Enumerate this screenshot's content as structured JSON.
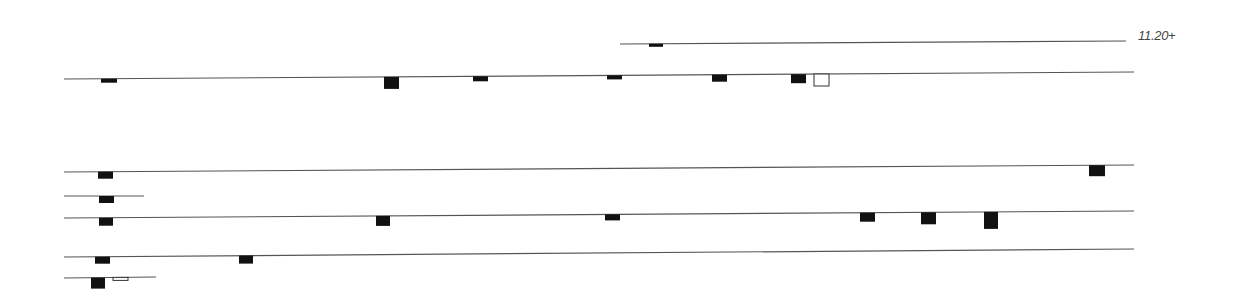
{
  "diagram": {
    "width": 1241,
    "height": 302,
    "line_color": "#555555",
    "fill_color": "#111111",
    "open_stroke": "#333333",
    "label": {
      "text": "11.20+",
      "x": 1138,
      "y": 28
    },
    "lines": [
      {
        "id": "line-1",
        "x1": 620,
        "y1": 44,
        "x2": 1126,
        "y2": 41,
        "marks": [
          {
            "x": 649,
            "w": 14,
            "h": 3,
            "type": "filled"
          }
        ]
      },
      {
        "id": "line-2",
        "x1": 64,
        "y1": 79,
        "x2": 1134,
        "y2": 72,
        "marks": [
          {
            "x": 101,
            "w": 16,
            "h": 4,
            "type": "filled"
          },
          {
            "x": 384,
            "w": 15,
            "h": 12,
            "type": "filled"
          },
          {
            "x": 473,
            "w": 15,
            "h": 5,
            "type": "filled"
          },
          {
            "x": 607,
            "w": 15,
            "h": 4,
            "type": "filled"
          },
          {
            "x": 712,
            "w": 15,
            "h": 7,
            "type": "filled"
          },
          {
            "x": 791,
            "w": 15,
            "h": 9,
            "type": "filled"
          },
          {
            "x": 814,
            "w": 15,
            "h": 12,
            "type": "open"
          }
        ]
      },
      {
        "id": "line-3",
        "x1": 64,
        "y1": 172,
        "x2": 1134,
        "y2": 165,
        "marks": [
          {
            "x": 98,
            "w": 15,
            "h": 7,
            "type": "filled"
          },
          {
            "x": 1089,
            "w": 16,
            "h": 11,
            "type": "filled"
          }
        ]
      },
      {
        "id": "line-4",
        "x1": 64,
        "y1": 196,
        "x2": 144,
        "y2": 196,
        "marks": [
          {
            "x": 99,
            "w": 15,
            "h": 7,
            "type": "filled"
          }
        ]
      },
      {
        "id": "line-5",
        "x1": 64,
        "y1": 218,
        "x2": 1134,
        "y2": 211,
        "marks": [
          {
            "x": 99,
            "w": 14,
            "h": 8,
            "type": "filled"
          },
          {
            "x": 376,
            "w": 14,
            "h": 10,
            "type": "filled"
          },
          {
            "x": 605,
            "w": 15,
            "h": 6,
            "type": "filled"
          },
          {
            "x": 860,
            "w": 15,
            "h": 9,
            "type": "filled"
          },
          {
            "x": 921,
            "w": 15,
            "h": 12,
            "type": "filled"
          },
          {
            "x": 984,
            "w": 14,
            "h": 17,
            "type": "filled"
          }
        ]
      },
      {
        "id": "line-6",
        "x1": 64,
        "y1": 257,
        "x2": 1134,
        "y2": 249,
        "marks": [
          {
            "x": 95,
            "w": 15,
            "h": 7,
            "type": "filled"
          },
          {
            "x": 239,
            "w": 14,
            "h": 8,
            "type": "filled"
          }
        ]
      },
      {
        "id": "line-7",
        "x1": 64,
        "y1": 278,
        "x2": 156,
        "y2": 277,
        "marks": [
          {
            "x": 91,
            "w": 14,
            "h": 11,
            "type": "filled"
          },
          {
            "x": 113,
            "w": 15,
            "h": 3,
            "type": "open"
          }
        ]
      }
    ]
  }
}
